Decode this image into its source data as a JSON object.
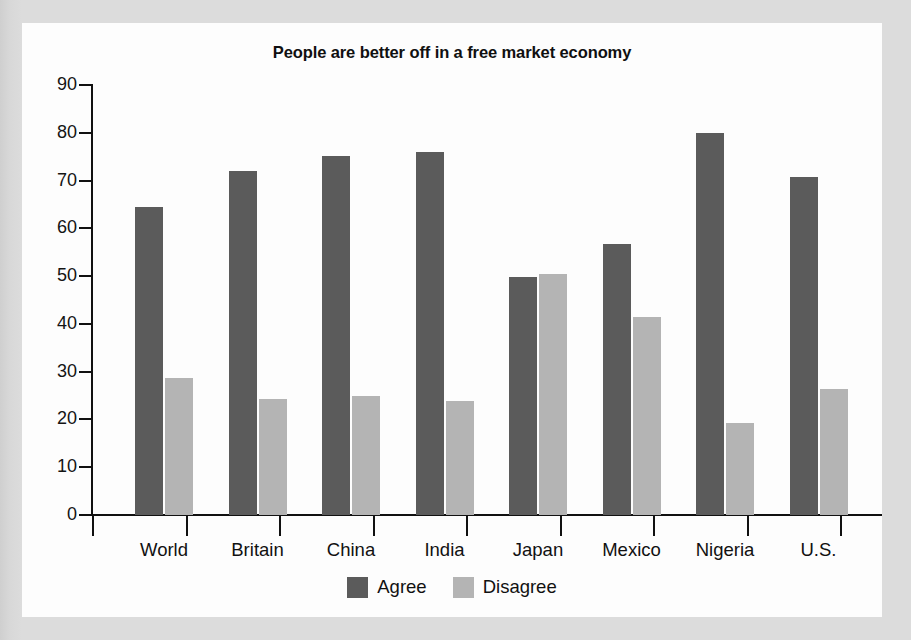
{
  "panel": {
    "background_color": "#fdfdfd",
    "page_background_color": "#d9d9d9"
  },
  "chart_data": {
    "type": "bar",
    "title": "People are better off in a free market economy",
    "xlabel": "",
    "ylabel": "",
    "ylim": [
      0,
      90
    ],
    "yticks": [
      0,
      10,
      20,
      30,
      40,
      50,
      60,
      70,
      80,
      90
    ],
    "ytick_labels": [
      "0",
      "10",
      "20",
      "30",
      "40",
      "50",
      "60",
      "70",
      "80",
      "90"
    ],
    "grid": false,
    "legend_position": "bottom-center",
    "categories": [
      "World",
      "Britain",
      "China",
      "India",
      "Japan",
      "Mexico",
      "Nigeria",
      "U.S."
    ],
    "series": [
      {
        "name": "Agree",
        "color": "#5b5b5b",
        "values": [
          64.5,
          72,
          75.2,
          76,
          49.8,
          56.8,
          80,
          70.8
        ]
      },
      {
        "name": "Disagree",
        "color": "#b4b4b4",
        "values": [
          28.7,
          24.2,
          25,
          23.8,
          50.4,
          41.4,
          19.2,
          26.3
        ]
      }
    ]
  }
}
